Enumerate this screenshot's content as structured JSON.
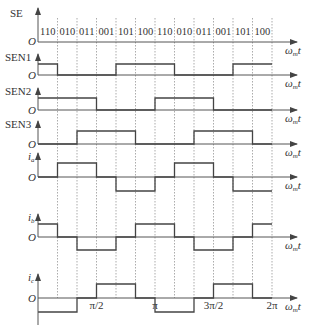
{
  "diagram": {
    "type": "timing-diagram",
    "x_axis_label": "ωmt",
    "origin_label": "O",
    "x0": 38,
    "segment_width": 19.5,
    "segments": 12,
    "x_ticks": [
      {
        "segment": 3,
        "label": "π/2"
      },
      {
        "segment": 6,
        "label": "π"
      },
      {
        "segment": 9,
        "label": "3π/2"
      },
      {
        "segment": 12,
        "label": "2π"
      }
    ],
    "se": {
      "label": "SE",
      "states": [
        "110",
        "010",
        "011",
        "001",
        "101",
        "100",
        "110",
        "010",
        "011",
        "001",
        "101",
        "100"
      ]
    },
    "rows": [
      {
        "id": "sen1",
        "label": "SEN1",
        "label_sub": "",
        "baseline": 75,
        "amp": 11,
        "levels": [
          1,
          0,
          0,
          0,
          1,
          1,
          1,
          0,
          0,
          0,
          1,
          1
        ]
      },
      {
        "id": "sen2",
        "label": "SEN2",
        "label_sub": "",
        "baseline": 110,
        "amp": 12,
        "levels": [
          1,
          1,
          1,
          0,
          0,
          0,
          1,
          1,
          1,
          0,
          0,
          0
        ]
      },
      {
        "id": "sen3",
        "label": "SEN3",
        "label_sub": "",
        "baseline": 144,
        "amp": 13,
        "levels": [
          0,
          0,
          1,
          1,
          1,
          0,
          0,
          0,
          1,
          1,
          1,
          0
        ]
      },
      {
        "id": "ia",
        "label": "i",
        "label_sub": "a",
        "baseline": 177,
        "amp": 14,
        "levels": [
          0,
          1,
          1,
          0,
          -1,
          -1,
          0,
          1,
          1,
          0,
          -1,
          -1
        ]
      },
      {
        "id": "ib",
        "label": "i",
        "label_sub": "b",
        "baseline": 237,
        "amp": 13,
        "levels": [
          1,
          0,
          -1,
          -1,
          0,
          1,
          1,
          0,
          -1,
          -1,
          0,
          1
        ]
      },
      {
        "id": "ic",
        "label": "i",
        "label_sub": "c",
        "baseline": 298,
        "amp": 14,
        "levels": [
          -1,
          -1,
          0,
          1,
          1,
          0,
          -1,
          -1,
          0,
          1,
          1,
          0
        ]
      }
    ],
    "colors": {
      "line": "#444444",
      "grid": "#888888",
      "text": "#333333"
    }
  }
}
